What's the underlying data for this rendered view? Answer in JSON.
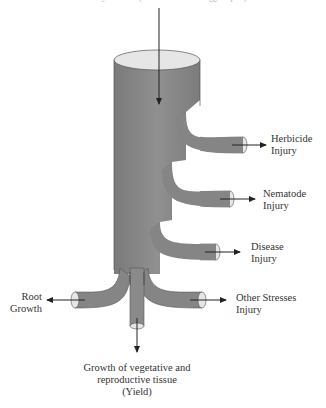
{
  "diagram": {
    "top_caption": "Photosynthesis (carbon and energy input)",
    "colors": {
      "pipe": "#8a8a8a",
      "pipe_dark": "#6e6e6e",
      "pipe_top": "#e6e6e6",
      "arrow": "#222222",
      "text": "#333333"
    },
    "branches": [
      {
        "id": "herbicide",
        "line1": "Herbicide",
        "line2": "Injury"
      },
      {
        "id": "nematode",
        "line1": "Nematode",
        "line2": "Injury"
      },
      {
        "id": "disease",
        "line1": "Disease",
        "line2": "Injury"
      },
      {
        "id": "other",
        "line1": "Other Stresses",
        "line2": "Injury"
      },
      {
        "id": "root",
        "line1": "Root",
        "line2": "Growth"
      }
    ],
    "bottom": {
      "line1": "Growth of vegetative and",
      "line2": "reproductive tissue",
      "line3": "(Yield)"
    }
  }
}
